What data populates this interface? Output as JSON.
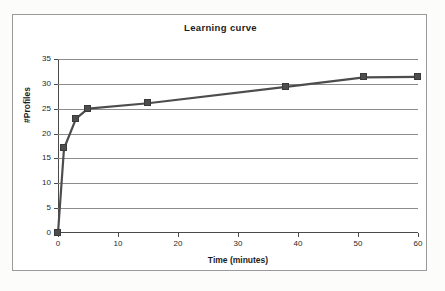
{
  "chart_data": {
    "type": "line",
    "title": "Learning curve",
    "xlabel": "Time (minutes)",
    "ylabel": "#Profiles",
    "xlim": [
      0,
      60
    ],
    "ylim": [
      0,
      35
    ],
    "xticks": [
      0,
      10,
      20,
      30,
      40,
      50,
      60
    ],
    "yticks": [
      0,
      5,
      10,
      15,
      20,
      25,
      30,
      35
    ],
    "grid": true,
    "legend": false,
    "legend_position": "none",
    "series": [
      {
        "name": "#Profiles",
        "marker": "square",
        "color": "#4d4d4d",
        "x": [
          0,
          1,
          3,
          5,
          15,
          38,
          51,
          60
        ],
        "y": [
          0,
          17,
          23,
          25,
          26.1,
          29.4,
          31.3,
          31.4
        ]
      }
    ]
  },
  "colors": {
    "series": "#4d4d4d",
    "grid": "#8c8c8c",
    "axis": "#4a4a4a",
    "frame": "#9a9a9a",
    "text": "#1c1c1c",
    "background": "#ffffff"
  }
}
